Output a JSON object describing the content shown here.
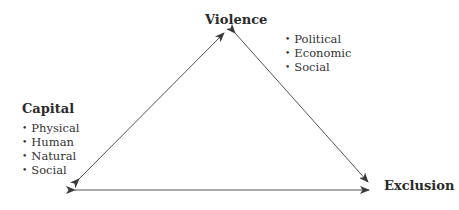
{
  "diagram": {
    "type": "triangle",
    "nodes": {
      "violence": {
        "label": "Violence",
        "items": [
          "Political",
          "Economic",
          "Social"
        ]
      },
      "capital": {
        "label": "Capital",
        "items": [
          "Physical",
          "Human",
          "Natural",
          "Social"
        ]
      },
      "exclusion": {
        "label": "Exclusion",
        "items": []
      }
    },
    "edges": [
      {
        "from": "capital",
        "to": "violence",
        "direction": "bidirectional"
      },
      {
        "from": "violence",
        "to": "exclusion",
        "direction": "bidirectional"
      },
      {
        "from": "capital",
        "to": "exclusion",
        "direction": "bidirectional"
      }
    ],
    "colors": {
      "line": "#4a4a4a",
      "text": "#2a2a2a"
    }
  }
}
